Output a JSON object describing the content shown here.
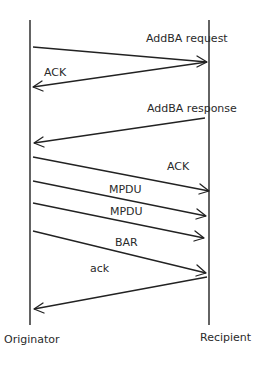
{
  "diagram": {
    "type": "sequence-diagram",
    "participants": [
      {
        "id": "originator",
        "label": "Originator",
        "x": 30
      },
      {
        "id": "recipient",
        "label": "Recipient",
        "x": 209
      }
    ],
    "messages": [
      {
        "label": "AddBA request",
        "from": "originator",
        "to": "recipient"
      },
      {
        "label": "ACK",
        "from": "recipient",
        "to": "originator"
      },
      {
        "label": "AddBA response",
        "from": "recipient",
        "to": "originator"
      },
      {
        "label": "ACK",
        "from": "originator",
        "to": "recipient"
      },
      {
        "label": "MPDU",
        "from": "originator",
        "to": "recipient"
      },
      {
        "label": "MPDU",
        "from": "originator",
        "to": "recipient"
      },
      {
        "label": "BAR",
        "from": "originator",
        "to": "recipient"
      },
      {
        "label": "ack",
        "from": "recipient",
        "to": "originator"
      }
    ]
  }
}
